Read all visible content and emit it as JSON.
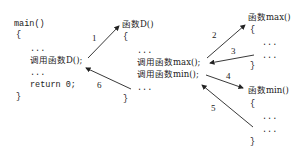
{
  "blocks": {
    "main": {
      "header": "main()",
      "open": "{",
      "lines": [
        "...",
        "调用函数D();",
        "...",
        "return 0;"
      ],
      "close": "}"
    },
    "funcD": {
      "header": "函数D()",
      "open": "{",
      "lines": [
        "...",
        "调用函数max();",
        "调用函数min();",
        "..."
      ],
      "close": "}"
    },
    "funcMax": {
      "header": "函数max()",
      "open": "{",
      "lines": [
        "...",
        "..."
      ],
      "close": "}"
    },
    "funcMin": {
      "header": "函数min()",
      "open": "{",
      "lines": [
        "...",
        "..."
      ],
      "close": "}"
    }
  },
  "arrows": [
    {
      "label": "1",
      "from": "main: 调用函数D()",
      "to": "函数D()"
    },
    {
      "label": "2",
      "from": "函数D: 调用函数max()",
      "to": "函数max()"
    },
    {
      "label": "3",
      "from": "函数max() end",
      "to": "函数D: 调用函数max()"
    },
    {
      "label": "4",
      "from": "函数D: 调用函数min()",
      "to": "函数min()"
    },
    {
      "label": "5",
      "from": "函数min() end",
      "to": "函数D: 调用函数min()"
    },
    {
      "label": "6",
      "from": "函数D() end",
      "to": "main: 调用函数D()"
    }
  ],
  "colors": {
    "ink": "#222222",
    "background": "#ffffff"
  }
}
